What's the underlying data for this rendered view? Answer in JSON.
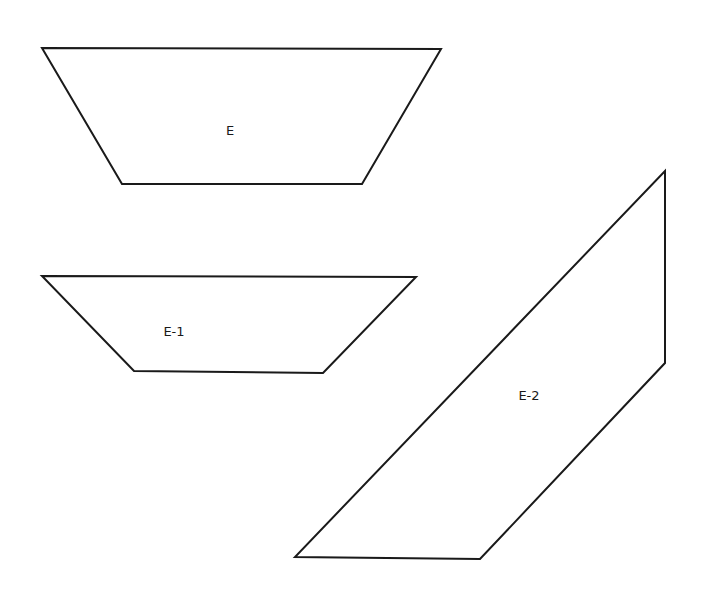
{
  "diagram": {
    "width": 711,
    "height": 614,
    "background": "#ffffff",
    "stroke_color": "#1a1a1a",
    "shapes": [
      {
        "id": "E",
        "type": "trapezoid",
        "label": "E",
        "points": [
          [
            42,
            48
          ],
          [
            441,
            49
          ],
          [
            362,
            184
          ],
          [
            122,
            184
          ]
        ],
        "label_pos": [
          230,
          131
        ]
      },
      {
        "id": "E-1",
        "type": "trapezoid",
        "label": "E-1",
        "points": [
          [
            42,
            276
          ],
          [
            416,
            277
          ],
          [
            323,
            373
          ],
          [
            134,
            371
          ]
        ],
        "label_pos": [
          174,
          332
        ]
      },
      {
        "id": "E-2",
        "type": "parallelogram",
        "label": "E-2",
        "points": [
          [
            665,
            171
          ],
          [
            665,
            363
          ],
          [
            480,
            559
          ],
          [
            295,
            557
          ]
        ],
        "label_pos": [
          529,
          396
        ]
      }
    ]
  }
}
